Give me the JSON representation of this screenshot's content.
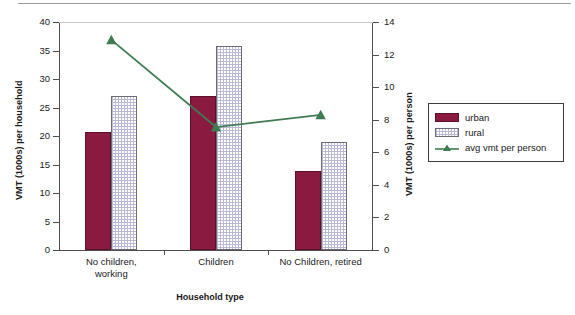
{
  "chart_data": {
    "type": "bar",
    "title": "",
    "subtitle": "",
    "xlabel": "Household type",
    "ylabel": "VMT (1000s) per household",
    "y2label": "VMT (1000s) per person",
    "categories": [
      "No children,\nworking",
      "Children",
      "No Children, retired"
    ],
    "categories_flat": [
      "No children, working",
      "Children",
      "No Children, retired"
    ],
    "ylim": [
      0,
      40
    ],
    "y2lim": [
      0,
      14
    ],
    "yticks": [
      "40",
      "35",
      "30",
      "25",
      "20",
      "15",
      "10",
      "5",
      "0"
    ],
    "ytick_values": [
      40,
      35,
      30,
      25,
      20,
      15,
      10,
      5,
      0
    ],
    "y2ticks": [
      "14",
      "12",
      "10",
      "8",
      "6",
      "4",
      "2",
      "0"
    ],
    "y2tick_values": [
      14,
      12,
      10,
      8,
      6,
      4,
      2,
      0
    ],
    "grid": false,
    "legend_position": "right",
    "series": [
      {
        "name": "urban",
        "kind": "bar",
        "axis": "left",
        "color": "#8b1a40",
        "values": [
          20.7,
          27.1,
          13.8
        ]
      },
      {
        "name": "rural",
        "kind": "bar",
        "axis": "left",
        "color": "#ffffff",
        "pattern": "checkered",
        "pattern_color": "#b9b9d4",
        "values": [
          27.1,
          35.8,
          19.0
        ]
      },
      {
        "name": "avg vmt per person",
        "kind": "line",
        "axis": "right",
        "color": "#3f7c51",
        "marker": "triangle",
        "values": [
          12.9,
          7.55,
          8.3
        ]
      }
    ]
  },
  "legend": {
    "entries": [
      {
        "label": "urban",
        "swatch": "urban"
      },
      {
        "label": "rural",
        "swatch": "rural"
      },
      {
        "label": "avg vmt per person",
        "swatch": "line"
      }
    ]
  },
  "colors": {
    "urban": "#8b1a40",
    "urban_border": "#5d1029",
    "rural_fill": "#ffffff",
    "rural_pattern": "#b9b9d4",
    "rural_border": "#6b6b78",
    "line": "#3f7c51",
    "axis": "#4d4d4d",
    "top_rule": "#9a9a9a"
  }
}
